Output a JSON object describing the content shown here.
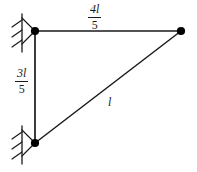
{
  "figure": {
    "type": "truss-diagram",
    "background_color": "#ffffff",
    "line_color": "#1a1a1a",
    "node_color": "#000000"
  },
  "nodes": [
    {
      "id": "top-left",
      "label": "",
      "x": 35,
      "y": 31,
      "support": "pin"
    },
    {
      "id": "top-right",
      "label": "",
      "x": 181,
      "y": 31,
      "support": "none"
    },
    {
      "id": "bottom-left",
      "label": "",
      "x": 35,
      "y": 143,
      "support": "pin"
    }
  ],
  "members": [
    {
      "id": "top-chord",
      "from": "top-left",
      "to": "top-right",
      "orientation": "horizontal"
    },
    {
      "id": "vertical",
      "from": "top-left",
      "to": "bottom-left",
      "orientation": "vertical"
    },
    {
      "id": "diagonal",
      "from": "bottom-left",
      "to": "top-right",
      "orientation": "diagonal"
    }
  ],
  "labels": {
    "top_chord": {
      "numerator": "4l",
      "denominator": "5",
      "is_fraction": true
    },
    "vertical": {
      "numerator": "3l",
      "denominator": "5",
      "is_fraction": true
    },
    "diagonal": {
      "text": "l",
      "is_fraction": false
    }
  },
  "supports": [
    {
      "id": "support-top-left",
      "kind": "pin",
      "hatch_marks": 3
    },
    {
      "id": "support-bottom-left",
      "kind": "pin",
      "hatch_marks": 3
    }
  ]
}
